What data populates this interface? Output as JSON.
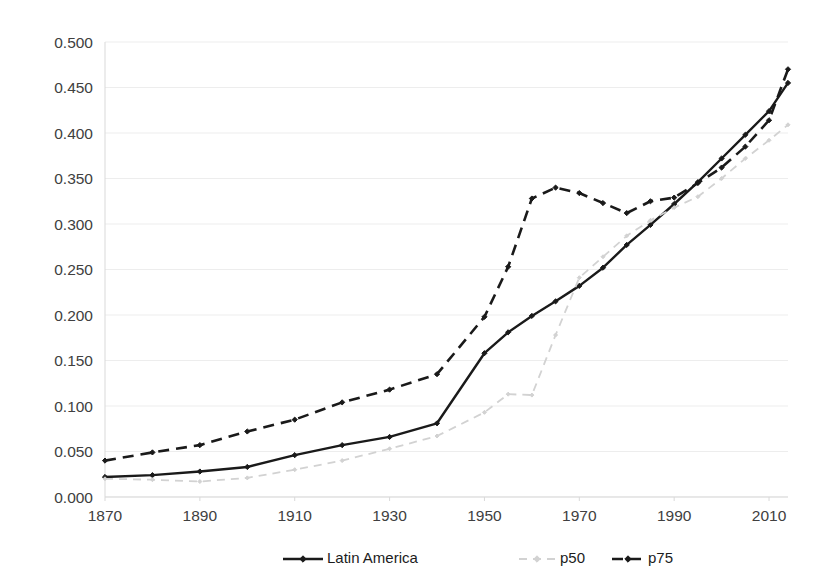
{
  "chart_data": {
    "type": "line",
    "title": "",
    "subtitle": "",
    "xlabel": "",
    "ylabel": "",
    "xlim": [
      1870,
      2014
    ],
    "ylim": [
      0.0,
      0.5
    ],
    "grid": true,
    "legend_position": "bottom-center",
    "xticks": [
      1870,
      1890,
      1910,
      1930,
      1950,
      1970,
      1990,
      2010
    ],
    "xtick_labels": [
      "1870",
      "1890",
      "1910",
      "1930",
      "1950",
      "1970",
      "1990",
      "2010"
    ],
    "yticks": [
      0.0,
      0.05,
      0.1,
      0.15,
      0.2,
      0.25,
      0.3,
      0.35,
      0.4,
      0.45,
      0.5
    ],
    "ytick_labels": [
      "0.000",
      "0.050",
      "0.100",
      "0.150",
      "0.200",
      "0.250",
      "0.300",
      "0.350",
      "0.400",
      "0.450",
      "0.500"
    ],
    "series": [
      {
        "name": "Latin America",
        "color": "#1a1a1a",
        "style": "solid",
        "marker": "diamond",
        "width": 2.4,
        "x": [
          1870,
          1880,
          1890,
          1900,
          1910,
          1920,
          1930,
          1940,
          1950,
          1955,
          1960,
          1965,
          1970,
          1975,
          1980,
          1985,
          1990,
          1995,
          2000,
          2005,
          2010,
          2014
        ],
        "y": [
          0.022,
          0.024,
          0.028,
          0.033,
          0.046,
          0.057,
          0.066,
          0.081,
          0.158,
          0.181,
          0.199,
          0.215,
          0.232,
          0.252,
          0.277,
          0.299,
          0.322,
          0.346,
          0.372,
          0.398,
          0.424,
          0.455
        ]
      },
      {
        "name": "p50",
        "color": "#d2d2d2",
        "style": "dashed",
        "marker": "diamond",
        "width": 1.8,
        "x": [
          1870,
          1880,
          1890,
          1900,
          1910,
          1920,
          1930,
          1940,
          1950,
          1955,
          1960,
          1965,
          1970,
          1975,
          1980,
          1985,
          1990,
          1995,
          2000,
          2005,
          2010,
          2014
        ],
        "y": [
          0.02,
          0.019,
          0.017,
          0.021,
          0.03,
          0.04,
          0.053,
          0.067,
          0.093,
          0.113,
          0.112,
          0.178,
          0.241,
          0.264,
          0.287,
          0.304,
          0.318,
          0.33,
          0.35,
          0.372,
          0.392,
          0.409
        ]
      },
      {
        "name": "p75",
        "color": "#1a1a1a",
        "style": "dashed",
        "marker": "diamond",
        "width": 2.6,
        "x": [
          1870,
          1880,
          1890,
          1900,
          1910,
          1920,
          1930,
          1940,
          1950,
          1955,
          1960,
          1965,
          1970,
          1975,
          1980,
          1985,
          1990,
          1995,
          2000,
          2005,
          2010,
          2014
        ],
        "y": [
          0.04,
          0.049,
          0.057,
          0.072,
          0.085,
          0.104,
          0.118,
          0.135,
          0.198,
          0.253,
          0.328,
          0.34,
          0.334,
          0.323,
          0.312,
          0.325,
          0.329,
          0.345,
          0.362,
          0.385,
          0.414,
          0.47
        ]
      }
    ]
  },
  "legend": {
    "items": [
      {
        "label": "Latin America"
      },
      {
        "label": "p50"
      },
      {
        "label": "p75"
      }
    ]
  }
}
